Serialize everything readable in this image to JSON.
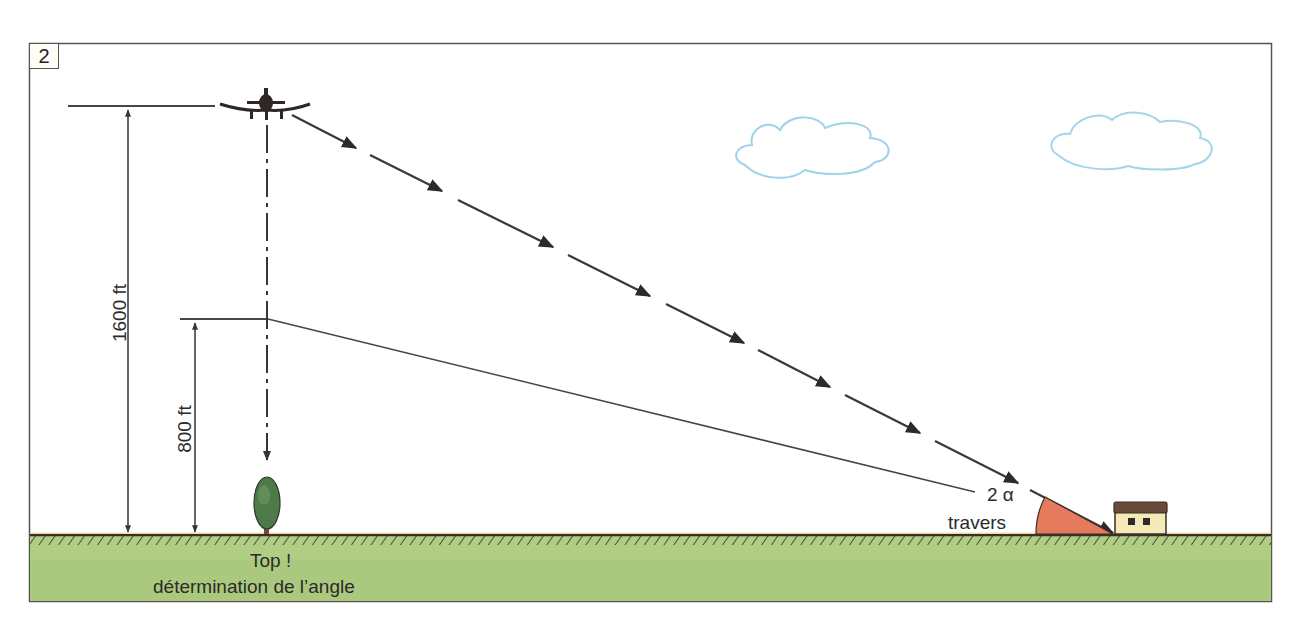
{
  "figure": {
    "number": "2",
    "labels": {
      "altitude_high": "1600 ft",
      "altitude_low": "800 ft",
      "top_line1": "Top !",
      "top_line2": "détermination de l’angle",
      "angle": "2 α",
      "angle_sub": "travers"
    },
    "elements": [
      "airplane",
      "tree",
      "house",
      "clouds",
      "ground",
      "angle-sector"
    ],
    "colors": {
      "sky": "#ffffff",
      "grass": "#a9c77c",
      "grass_light": "#c5da9c",
      "ground_line": "#3a2e28",
      "sector": "#e57a5c",
      "cloud": "#8fc9e6",
      "line": "#3b3535",
      "house_wall": "#f6e9b8",
      "house_roof": "#6a4a3a",
      "tree": "#4e7a4a"
    }
  }
}
